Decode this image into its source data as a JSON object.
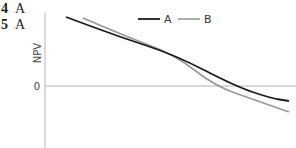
{
  "questions": [
    {
      "number": "4",
      "answer": "A"
    },
    {
      "number": "5",
      "answer": "A"
    }
  ],
  "chart_data": {
    "type": "line",
    "title": "",
    "xlabel": "",
    "ylabel": "NPV",
    "y_tick_labels": [
      "0"
    ],
    "grid": false,
    "legend_position": "top-right",
    "series": [
      {
        "name": "A",
        "color": "#1a1a1a",
        "points": [
          [
            66,
            17
          ],
          [
            120,
            37
          ],
          [
            175,
            55
          ],
          [
            235,
            86
          ],
          [
            270,
            98
          ],
          [
            289,
            101
          ]
        ]
      },
      {
        "name": "B",
        "color": "#999999",
        "points": [
          [
            83,
            18
          ],
          [
            130,
            38
          ],
          [
            175,
            55
          ],
          [
            215,
            86
          ],
          [
            255,
            100
          ],
          [
            289,
            112
          ]
        ]
      }
    ]
  },
  "legend": {
    "a_label": "A",
    "b_label": "B"
  },
  "axis": {
    "ylabel": "NPV",
    "zero_label": "0"
  }
}
